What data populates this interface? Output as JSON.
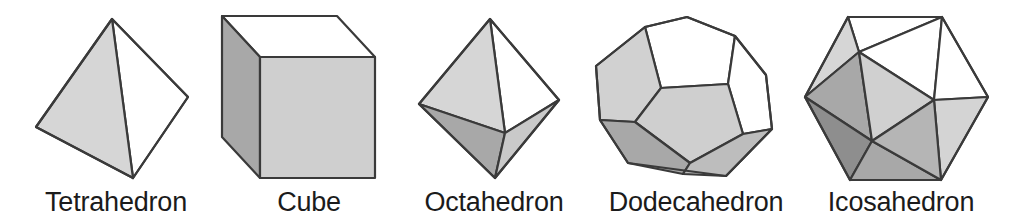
{
  "figure": {
    "background_color": "#ffffff",
    "stroke_color": "#3a3a3a",
    "label_color": "#1b1b1b",
    "palette": {
      "white_face": "#ffffff",
      "light_gray_face": "#d6d6d6",
      "medium_gray_face": "#c2c2c2",
      "gray_face": "#a8a8a8",
      "dark_gray_face": "#8e8e8e"
    }
  },
  "solids": [
    {
      "id": "tetrahedron",
      "label": "Tetrahedron",
      "faces": 4,
      "vertices": 4,
      "edges": 6,
      "face_shape": "triangle"
    },
    {
      "id": "cube",
      "label": "Cube",
      "faces": 6,
      "vertices": 8,
      "edges": 12,
      "face_shape": "square"
    },
    {
      "id": "octahedron",
      "label": "Octahedron",
      "faces": 8,
      "vertices": 6,
      "edges": 12,
      "face_shape": "triangle"
    },
    {
      "id": "dodecahedron",
      "label": "Dodecahedron",
      "faces": 12,
      "vertices": 20,
      "edges": 30,
      "face_shape": "pentagon"
    },
    {
      "id": "icosahedron",
      "label": "Icosahedron",
      "faces": 20,
      "vertices": 12,
      "edges": 30,
      "face_shape": "triangle"
    }
  ]
}
